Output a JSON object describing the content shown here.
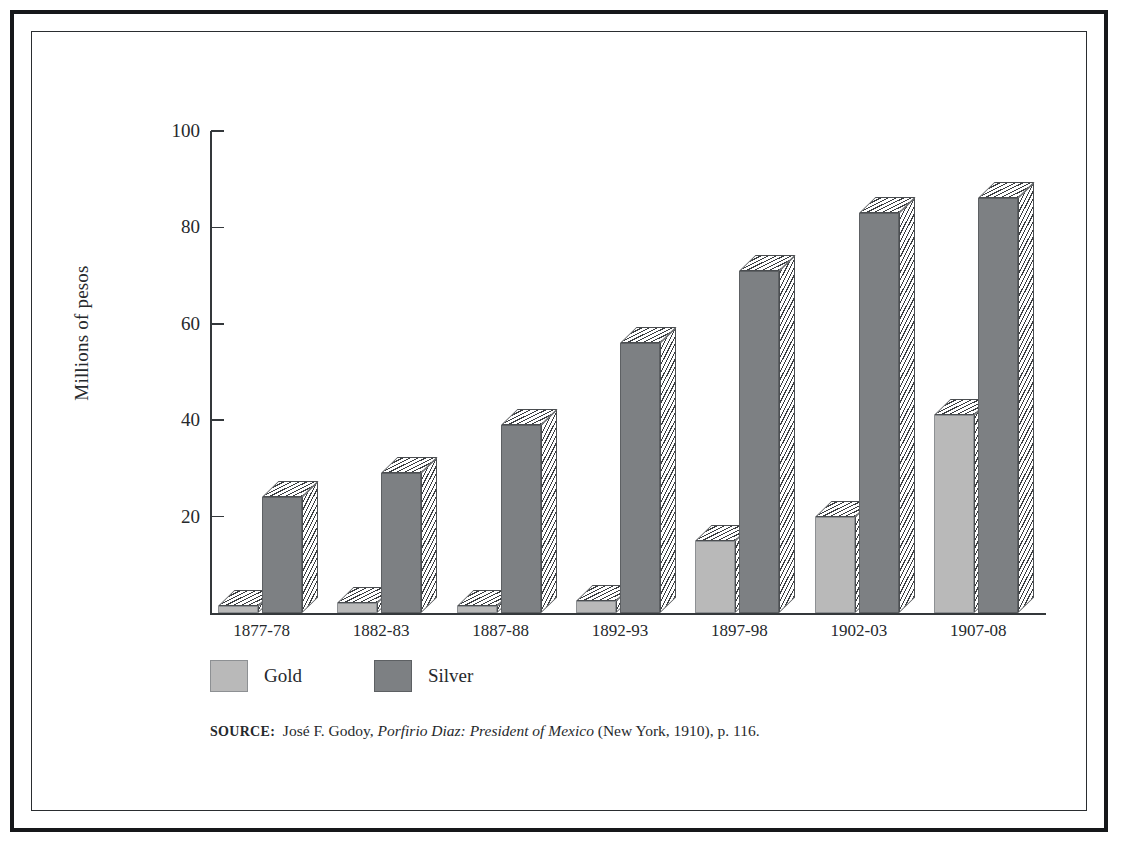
{
  "figure": {
    "frame": "double-rule-border",
    "background": "#ffffff"
  },
  "chart_data": {
    "type": "bar",
    "title": "",
    "xlabel": "",
    "ylabel": "Millions of pesos",
    "ylim": [
      0,
      100
    ],
    "yticks": [
      0,
      20,
      40,
      60,
      80,
      100
    ],
    "ytick_labels": [
      "20",
      "40",
      "60",
      "80",
      "100"
    ],
    "grid": false,
    "legend_position": "below-axes-left",
    "categories": [
      "1877-78",
      "1882-83",
      "1887-88",
      "1892-93",
      "1897-98",
      "1902-03",
      "1907-08"
    ],
    "series": [
      {
        "name": "Gold",
        "color": "#b9b9b9",
        "values": [
          1.5,
          2,
          1.5,
          2.5,
          15,
          20,
          41
        ]
      },
      {
        "name": "Silver",
        "color": "#7d8083",
        "values": [
          24,
          29,
          39,
          56,
          71,
          83,
          86
        ]
      }
    ]
  },
  "axis": {
    "y_label": "Millions of pesos",
    "y_tick_labels": [
      "100",
      "80",
      "60",
      "40",
      "20"
    ],
    "x_tick_labels": [
      "1877-78",
      "1882-83",
      "1887-88",
      "1892-93",
      "1897-98",
      "1902-03",
      "1907-08"
    ]
  },
  "legend": {
    "entries": [
      {
        "label": "Gold",
        "color": "#b9b9b9"
      },
      {
        "label": "Silver",
        "color": "#7d8083"
      }
    ]
  },
  "source": {
    "prefix": "SOURCE:",
    "author": "José F. Godoy,",
    "title": "Porfirio Diaz: President of Mexico",
    "publication": "(New York, 1910), p. 116."
  }
}
